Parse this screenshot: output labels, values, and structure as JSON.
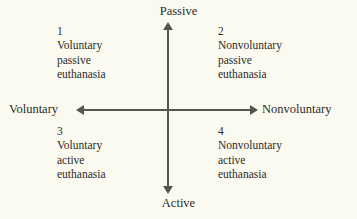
{
  "diagram": {
    "type": "quadrant",
    "colors": {
      "background": "#fbfaf1",
      "axis": "#55564c",
      "text": "#2b2b26"
    },
    "axes": {
      "vertical": {
        "top_label": "Passive",
        "bottom_label": "Active"
      },
      "horizontal": {
        "left_label": "Voluntary",
        "right_label": "Nonvoluntary"
      }
    },
    "quadrants": [
      {
        "number": "1",
        "position": "top-left",
        "line1": "Voluntary",
        "line2": "passive",
        "line3": "euthanasia"
      },
      {
        "number": "2",
        "position": "top-right",
        "line1": "Nonvoluntary",
        "line2": "passive",
        "line3": "euthanasia"
      },
      {
        "number": "3",
        "position": "bottom-left",
        "line1": "Voluntary",
        "line2": "active",
        "line3": "euthanasia"
      },
      {
        "number": "4",
        "position": "bottom-right",
        "line1": "Nonvoluntary",
        "line2": "active",
        "line3": "euthanasia"
      }
    ],
    "icons": {
      "arrow_up": "arrow-up-icon",
      "arrow_down": "arrow-down-icon",
      "arrow_left": "arrow-left-icon",
      "arrow_right": "arrow-right-icon"
    }
  }
}
